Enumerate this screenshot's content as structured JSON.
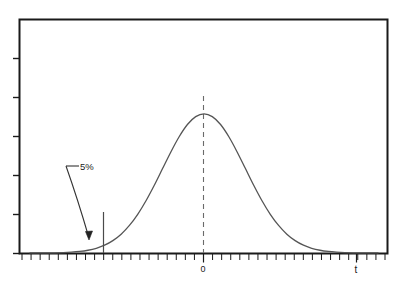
{
  "figure": {
    "background_color": "#ffffff",
    "frame_color": "#1a1a1a",
    "curve_color": "#555555",
    "annotation_color": "#333333"
  },
  "labels": {
    "origin_tick": "0",
    "x_axis_name": "t",
    "tail_area": "5%"
  },
  "chart_data": {
    "type": "line",
    "title": "",
    "subtitle": "",
    "xlabel": "t",
    "ylabel": "",
    "grid": false,
    "legend": false,
    "legend_position": "none",
    "xlim": [
      -4.2,
      4.2
    ],
    "ylim": [
      0,
      0.45
    ],
    "xticks_labeled": [
      {
        "x": 0,
        "label": "0"
      }
    ],
    "xtick_minor_count": 41,
    "ytick_count": 6,
    "series": [
      {
        "name": "t density",
        "kind": "curve",
        "x": [
          -4.2,
          -4.0,
          -3.8,
          -3.6,
          -3.4,
          -3.2,
          -3.0,
          -2.8,
          -2.6,
          -2.4,
          -2.2,
          -2.0,
          -1.8,
          -1.6,
          -1.4,
          -1.2,
          -1.0,
          -0.8,
          -0.6,
          -0.4,
          -0.2,
          0.0,
          0.2,
          0.4,
          0.6,
          0.8,
          1.0,
          1.2,
          1.4,
          1.6,
          1.8,
          2.0,
          2.2,
          2.4,
          2.6,
          2.8,
          3.0,
          3.2,
          3.4,
          3.6,
          3.8,
          4.0,
          4.2
        ],
        "y": [
          0.0001,
          0.0001,
          0.0004,
          0.0006,
          0.0012,
          0.0024,
          0.0044,
          0.0079,
          0.0136,
          0.0224,
          0.0355,
          0.054,
          0.079,
          0.1109,
          0.1497,
          0.1942,
          0.242,
          0.2897,
          0.3332,
          0.3683,
          0.391,
          0.3989,
          0.391,
          0.3683,
          0.3332,
          0.2897,
          0.242,
          0.1942,
          0.1497,
          0.1109,
          0.079,
          0.054,
          0.0355,
          0.0224,
          0.0136,
          0.0079,
          0.0044,
          0.0024,
          0.0012,
          0.0006,
          0.0004,
          0.0001,
          0.0001
        ]
      }
    ],
    "annotations": [
      {
        "name": "tail-area-label",
        "text": "5%",
        "x": -2.0,
        "y": 0.23,
        "arrow_to_x": -2.45,
        "arrow_to_y": 0.035
      },
      {
        "name": "critical-value-line",
        "kind": "vline-solid",
        "x": -1.645,
        "y_from": 0.0,
        "y_to": 0.105
      },
      {
        "name": "center-line",
        "kind": "vline-dashed",
        "x": 0.0,
        "y_from": 0.0,
        "y_to": 0.3989
      }
    ]
  }
}
